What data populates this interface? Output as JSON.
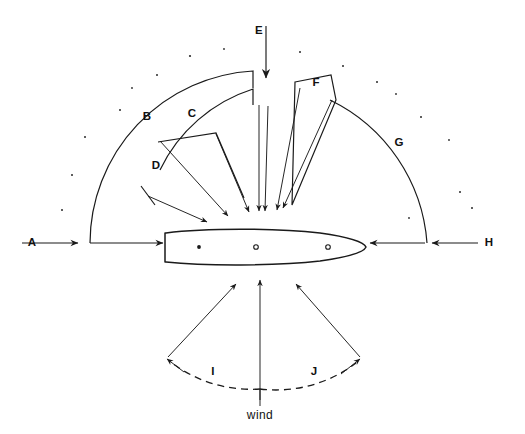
{
  "diagram": {
    "type": "technical-line-diagram",
    "canvas": {
      "width": 525,
      "height": 434
    },
    "background_color": "#ffffff",
    "line_color": "#1a1a1a",
    "labels": [
      {
        "id": "A",
        "text": "A",
        "x": 32,
        "y": 246,
        "role": "left-horizontal-sector-label"
      },
      {
        "id": "B",
        "text": "B",
        "x": 147,
        "y": 120,
        "role": "outer-arc-sector-label"
      },
      {
        "id": "C",
        "text": "C",
        "x": 192,
        "y": 117,
        "role": "second-arc-sector-label"
      },
      {
        "id": "D",
        "text": "D",
        "x": 156,
        "y": 169,
        "role": "inner-wedge-sector-label"
      },
      {
        "id": "E",
        "text": "E",
        "x": 259,
        "y": 34,
        "role": "top-vertical-arrow-label"
      },
      {
        "id": "F",
        "text": "F",
        "x": 316,
        "y": 86,
        "role": "right-wedge-sector-label"
      },
      {
        "id": "G",
        "text": "G",
        "x": 399,
        "y": 146,
        "role": "right-outer-arc-label"
      },
      {
        "id": "H",
        "text": "H",
        "x": 489,
        "y": 246,
        "role": "right-horizontal-sector-label"
      },
      {
        "id": "I",
        "text": "I",
        "x": 213,
        "y": 375,
        "role": "left-wind-angle-label"
      },
      {
        "id": "J",
        "text": "J",
        "x": 314,
        "y": 375,
        "role": "right-wind-angle-label"
      }
    ],
    "wind_label": {
      "text": "wind",
      "x": 260,
      "y": 419
    },
    "hull": {
      "description": "boat hull plan view, bow to the right, flat transom at left",
      "stern_x": 165,
      "bow_x": 366,
      "center_y": 247,
      "port_markers": [
        {
          "x": 199,
          "y": 247,
          "style": "filled"
        },
        {
          "x": 256,
          "y": 247,
          "style": "open"
        },
        {
          "x": 328,
          "y": 247,
          "style": "open"
        }
      ]
    },
    "sectors": [
      {
        "id": "A",
        "kind": "horizontal-arrow-pair",
        "side": "left",
        "direction": "right"
      },
      {
        "id": "B",
        "kind": "outer-arc",
        "side": "left",
        "radius": 173
      },
      {
        "id": "C",
        "kind": "arc",
        "side": "left",
        "radius": 155
      },
      {
        "id": "D",
        "kind": "wedge",
        "side": "left"
      },
      {
        "id": "E",
        "kind": "vertical-arrow",
        "side": "center",
        "direction": "down"
      },
      {
        "id": "F",
        "kind": "wedge",
        "side": "right"
      },
      {
        "id": "G",
        "kind": "outer-arc",
        "side": "right",
        "radius": 173
      },
      {
        "id": "H",
        "kind": "horizontal-arrow-pair",
        "side": "right",
        "direction": "left"
      },
      {
        "id": "I",
        "kind": "dashed-angle-arc",
        "side": "left"
      },
      {
        "id": "J",
        "kind": "dashed-angle-arc",
        "side": "right"
      }
    ],
    "specks": [
      [
        157,
        75
      ],
      [
        190,
        56
      ],
      [
        224,
        49
      ],
      [
        300,
        52
      ],
      [
        343,
        66
      ],
      [
        377,
        82
      ],
      [
        120,
        110
      ],
      [
        85,
        137
      ],
      [
        421,
        117
      ],
      [
        449,
        140
      ],
      [
        460,
        192
      ],
      [
        72,
        175
      ],
      [
        62,
        210
      ],
      [
        409,
        218
      ],
      [
        472,
        208
      ],
      [
        196,
        37
      ],
      [
        317,
        38
      ],
      [
        132,
        88
      ],
      [
        396,
        94
      ]
    ]
  }
}
